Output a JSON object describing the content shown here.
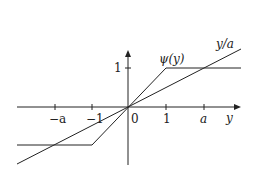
{
  "diagram": {
    "type": "function-plot",
    "axes": {
      "x_label": "y",
      "origin_label": "0",
      "x_ticks": [
        {
          "label": "−a",
          "value": "-a"
        },
        {
          "label": "−1",
          "value": -1
        },
        {
          "label": "1",
          "value": 1
        },
        {
          "label": "a",
          "value": "a"
        }
      ],
      "y_ticks": [
        {
          "label": "1",
          "value": 1
        }
      ]
    },
    "curves": [
      {
        "name": "psi",
        "label": "ψ(y)",
        "description": "clipped identity: -1 for y<-1, y for -1<=y<=1, 1 for y>1"
      },
      {
        "name": "linear",
        "label": "y/a",
        "description": "straight line through origin with slope 1/a, crossing 1 at y=a"
      }
    ],
    "colors": {
      "line": "#222222",
      "background": "#ffffff"
    }
  }
}
